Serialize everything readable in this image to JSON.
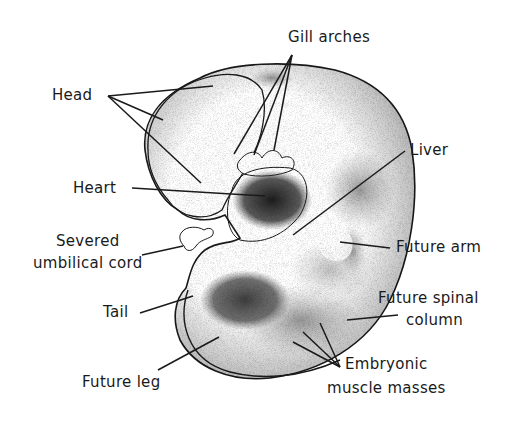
{
  "diagram": {
    "labels": {
      "head": "Head",
      "gill_arches": "Gill arches",
      "heart": "Heart",
      "liver": "Liver",
      "umbilical_line1": "Severed",
      "umbilical_line2": "umbilical cord",
      "future_arm": "Future arm",
      "tail": "Tail",
      "spinal_line1": "Future spinal",
      "spinal_line2": "column",
      "future_leg": "Future leg",
      "muscle_line1": "Embryonic",
      "muscle_line2": "muscle masses"
    },
    "colors": {
      "ink": "#1a1a1a",
      "background": "#ffffff",
      "shading_dark": "#2b2b2b",
      "shading_mid": "#8a8a8a"
    }
  }
}
